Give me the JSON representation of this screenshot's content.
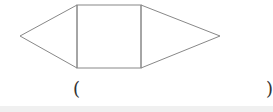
{
  "figure": {
    "stroke_color": "#888888",
    "left_triangle_apex": [
      20,
      36
    ],
    "square": {
      "x": 77,
      "y": 5,
      "w": 64,
      "h": 63
    },
    "right_triangle_apex": [
      220,
      36
    ]
  },
  "answer": {
    "open_paren": "(",
    "close_paren": ")",
    "value": ""
  }
}
